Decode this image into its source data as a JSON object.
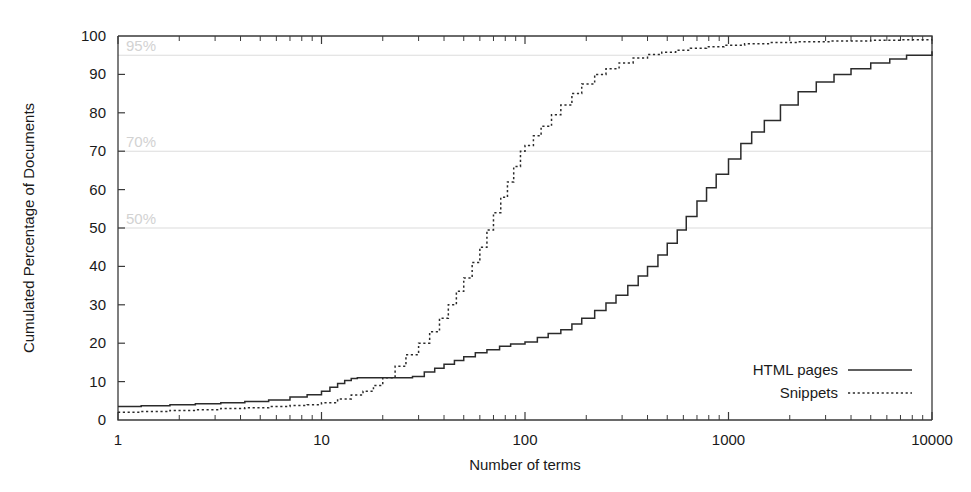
{
  "chart_data": {
    "type": "line",
    "title": "",
    "xlabel": "Number of terms",
    "ylabel": "Cumulated Percentage of Documents",
    "xscale": "log",
    "xlim": [
      1,
      10000
    ],
    "ylim": [
      0,
      100
    ],
    "grid": false,
    "legend_position": "bottom-right",
    "xticks": [
      "1",
      "10",
      "100",
      "1000",
      "10000"
    ],
    "xtick_values": [
      1,
      10,
      100,
      1000,
      10000
    ],
    "yticks": [
      "0",
      "10",
      "20",
      "30",
      "40",
      "50",
      "60",
      "70",
      "80",
      "90",
      "100"
    ],
    "ytick_values": [
      0,
      10,
      20,
      30,
      40,
      50,
      60,
      70,
      80,
      90,
      100
    ],
    "annotations": [
      {
        "label": "95%",
        "value": 95,
        "color": "#d2d2d2"
      },
      {
        "label": "70%",
        "value": 70,
        "color": "#d2d2d2"
      },
      {
        "label": "50%",
        "value": 50,
        "color": "#d2d2d2"
      }
    ],
    "series": [
      {
        "name": "HTML pages",
        "style": "solid",
        "color": "#2b2b2b",
        "x": [
          1,
          1.3,
          1.8,
          2.4,
          3.2,
          4.2,
          5.5,
          7,
          8.5,
          10,
          11,
          12,
          13,
          14,
          15,
          17,
          19,
          21,
          24,
          28,
          32,
          36,
          40,
          45,
          50,
          57,
          65,
          75,
          85,
          100,
          115,
          130,
          150,
          170,
          190,
          220,
          250,
          280,
          320,
          360,
          400,
          450,
          500,
          560,
          620,
          700,
          780,
          870,
          1000,
          1150,
          1300,
          1500,
          1800,
          2200,
          2700,
          3300,
          4000,
          5000,
          6200,
          7500,
          10000
        ],
        "y": [
          3.5,
          3.7,
          4,
          4.2,
          4.5,
          4.8,
          5.2,
          6,
          6.6,
          7.5,
          8.5,
          9.5,
          10.3,
          10.8,
          11,
          11,
          11,
          11,
          11,
          11.3,
          12.5,
          13.5,
          14.5,
          15.5,
          16.5,
          17.5,
          18.3,
          19.2,
          19.8,
          20.3,
          21.5,
          22.5,
          23.5,
          25,
          26.5,
          28.5,
          30.5,
          32.5,
          35,
          37.5,
          40,
          43,
          46,
          49.5,
          53,
          57,
          60.5,
          64,
          68,
          72,
          75,
          78,
          82,
          85.5,
          88,
          90,
          91.5,
          93,
          94,
          95,
          96
        ]
      },
      {
        "name": "Snippets",
        "style": "dotted",
        "color": "#2b2b2b",
        "x": [
          1,
          1.3,
          1.8,
          2.4,
          3.2,
          4.2,
          5.5,
          7,
          8.5,
          10,
          12,
          14,
          16,
          18,
          20,
          23,
          26,
          30,
          34,
          38,
          42,
          46,
          50,
          55,
          60,
          65,
          70,
          76,
          82,
          88,
          95,
          100,
          110,
          120,
          135,
          150,
          170,
          190,
          220,
          250,
          290,
          340,
          400,
          470,
          550,
          650,
          780,
          950,
          1200,
          1600,
          2200,
          3200,
          5000,
          7000,
          10000
        ],
        "y": [
          2,
          2.2,
          2.5,
          2.7,
          3,
          3.2,
          3.5,
          3.8,
          4,
          4.5,
          5.5,
          6.5,
          7.5,
          9,
          11,
          14,
          17,
          20,
          23,
          26.5,
          30,
          33.5,
          37,
          41,
          45,
          49.5,
          54,
          58,
          62,
          66,
          70,
          71.5,
          74,
          76.5,
          79.5,
          82,
          85,
          87.5,
          90,
          91.5,
          93,
          94.3,
          95.2,
          95.8,
          96.3,
          96.8,
          97.2,
          97.6,
          98,
          98.3,
          98.5,
          98.7,
          98.9,
          99,
          99.1
        ]
      }
    ]
  },
  "legend": {
    "items": [
      {
        "label": "HTML pages",
        "style": "solid"
      },
      {
        "label": "Snippets",
        "style": "dotted"
      }
    ]
  }
}
